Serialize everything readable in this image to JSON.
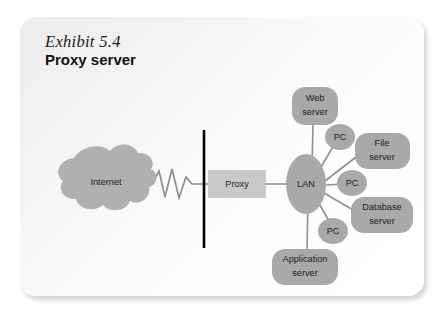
{
  "figure": {
    "exhibit_label": "Exhibit 5.4",
    "title": "Proxy server"
  },
  "diagram": {
    "type": "network-topology",
    "colors": {
      "node_fill": "#a9a9a9",
      "cloud_fill": "#b0b0b0",
      "proxy_fill": "#c9c9c9",
      "line": "#8f8f8f",
      "firewall": "#000000",
      "card_background": "#f4f4f4",
      "text": "#1d1d1d"
    },
    "nodes": {
      "internet": "Internet",
      "proxy": "Proxy",
      "lan": "LAN",
      "web_server_line1": "Web",
      "web_server_line2": "server",
      "file_server_line1": "File",
      "file_server_line2": "server",
      "database_server_line1": "Database",
      "database_server_line2": "server",
      "application_server_line1": "Application",
      "application_server_line2": "server",
      "pc_top": "PC",
      "pc_middle": "PC",
      "pc_bottom": "PC"
    },
    "connections": [
      "Internet to firewall (zigzag link)",
      "Firewall to Proxy",
      "Proxy to LAN",
      "LAN to Web server",
      "LAN to PC (top)",
      "LAN to File server",
      "LAN to PC (middle)",
      "LAN to Database server",
      "LAN to PC (bottom)",
      "LAN to Application server"
    ]
  }
}
